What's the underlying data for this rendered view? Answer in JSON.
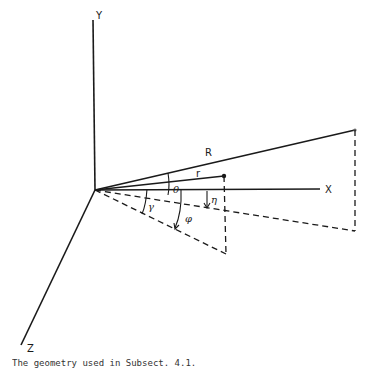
{
  "diagram": {
    "axes": {
      "x_label": "X",
      "y_label": "Y",
      "z_label": "Z"
    },
    "vectors": {
      "R_label": "R",
      "r_label": "r"
    },
    "angles": {
      "theta": "θ",
      "eta": "η",
      "gamma": "γ",
      "phi": "φ"
    },
    "caption": "The geometry used in Subsect. 4.1."
  }
}
